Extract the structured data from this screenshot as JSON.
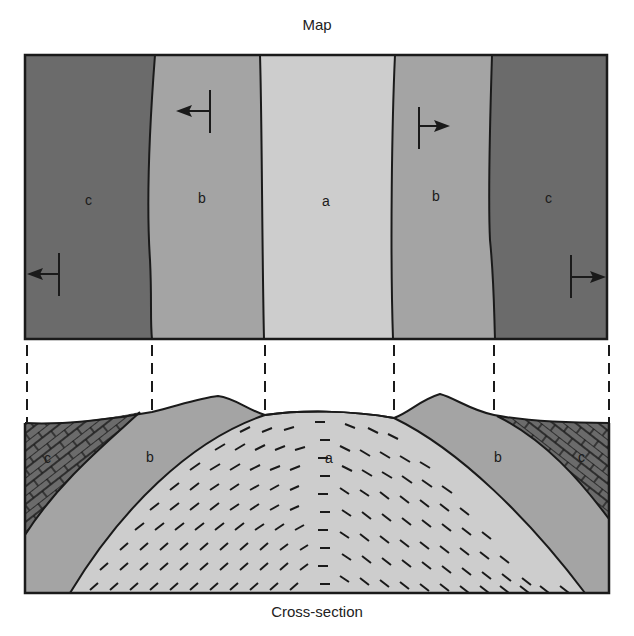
{
  "map": {
    "title": "Map",
    "units": [
      {
        "label": "c",
        "position": "left-outer",
        "color": "#6b6b6b"
      },
      {
        "label": "b",
        "position": "left-inner",
        "color": "#a4a4a4"
      },
      {
        "label": "a",
        "position": "center",
        "color": "#cdcdcd"
      },
      {
        "label": "b",
        "position": "right-inner",
        "color": "#a4a4a4"
      },
      {
        "label": "c",
        "position": "right-outer",
        "color": "#6b6b6b"
      }
    ],
    "dip_symbols": [
      {
        "unit": "b",
        "side": "left",
        "direction": "west"
      },
      {
        "unit": "b",
        "side": "right",
        "direction": "east"
      },
      {
        "unit": "c",
        "side": "left",
        "direction": "west"
      },
      {
        "unit": "c",
        "side": "right",
        "direction": "east"
      }
    ]
  },
  "cross_section": {
    "title": "Cross-section",
    "labels": {
      "c_left": "c",
      "b_left": "b",
      "a": "a",
      "b_right": "b",
      "c_right": "c"
    }
  },
  "colors": {
    "c": "#6b6b6b",
    "b": "#a4a4a4",
    "a": "#cdcdcd",
    "line": "#1a1a1a"
  }
}
